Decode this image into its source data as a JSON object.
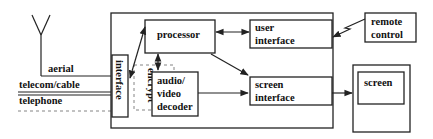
{
  "diagram": {
    "type": "block-diagram",
    "inputs": {
      "aerial": "aerial",
      "telecom_cable": "telecom/cable",
      "telephone": "telephone"
    },
    "blocks": {
      "interface": "interface",
      "encrypt": "encrypt",
      "processor": "processor",
      "user_interface_line1": "user",
      "user_interface_line2": "interface",
      "decoder_line1": "audio/",
      "decoder_line2": "video",
      "decoder_line3": "decoder",
      "screen_interface_line1": "screen",
      "screen_interface_line2": "interface",
      "remote_line1": "remote",
      "remote_line2": "control",
      "screen": "screen"
    },
    "connections": [
      {
        "from": "aerial",
        "to": "interface"
      },
      {
        "from": "telecom/cable",
        "to": "interface"
      },
      {
        "from": "telephone",
        "to": "interface",
        "style": "dashed"
      },
      {
        "from": "interface",
        "to": "processor",
        "bidirectional": true
      },
      {
        "from": "processor",
        "to": "user interface",
        "bidirectional": true
      },
      {
        "from": "processor",
        "to": "audio/video decoder",
        "bidirectional": true
      },
      {
        "from": "processor",
        "to": "screen interface"
      },
      {
        "from": "audio/video decoder",
        "to": "screen interface"
      },
      {
        "from": "remote control",
        "to": "user interface",
        "style": "wireless"
      },
      {
        "from": "screen interface",
        "to": "screen"
      }
    ]
  }
}
